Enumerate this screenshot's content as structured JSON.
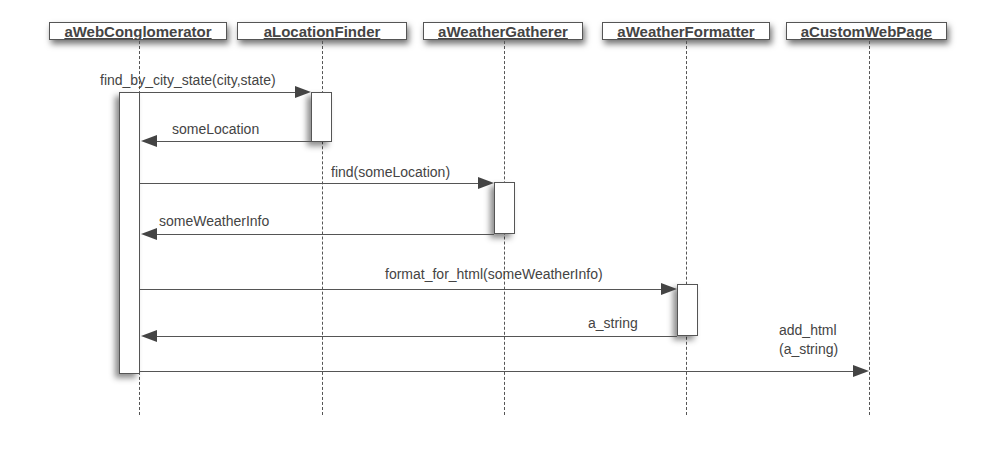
{
  "diagram": {
    "type": "uml-sequence",
    "objects": [
      {
        "name": "aWebConglomerator"
      },
      {
        "name": "aLocationFinder"
      },
      {
        "name": "aWeatherGatherer"
      },
      {
        "name": "aWeatherFormatter"
      },
      {
        "name": "aCustomWebPage"
      }
    ],
    "messages": [
      {
        "from": "aWebConglomerator",
        "to": "aLocationFinder",
        "label": "find_by_city_state(city,state)",
        "kind": "call"
      },
      {
        "from": "aLocationFinder",
        "to": "aWebConglomerator",
        "label": "someLocation",
        "kind": "return"
      },
      {
        "from": "aWebConglomerator",
        "to": "aWeatherGatherer",
        "label": "find(someLocation)",
        "kind": "call"
      },
      {
        "from": "aWeatherGatherer",
        "to": "aWebConglomerator",
        "label": "someWeatherInfo",
        "kind": "return"
      },
      {
        "from": "aWebConglomerator",
        "to": "aWeatherFormatter",
        "label": "format_for_html(someWeatherInfo)",
        "kind": "call"
      },
      {
        "from": "aWeatherFormatter",
        "to": "aWebConglomerator",
        "label": "a_string",
        "kind": "return"
      },
      {
        "from": "aWebConglomerator",
        "to": "aCustomWebPage",
        "label_line1": "add_html",
        "label_line2": "(a_string)",
        "kind": "call"
      }
    ]
  }
}
